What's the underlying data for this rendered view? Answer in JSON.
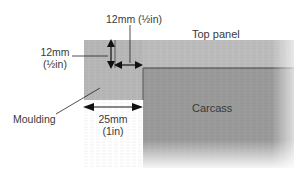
{
  "diagram": {
    "type": "woodworking cross-section",
    "labels": {
      "top_dim_a": "12mm (½in)",
      "left_dim_line1": "12mm",
      "left_dim_line2": "(½in)",
      "top_panel": "Top panel",
      "carcass": "Carcass",
      "moulding": "Moulding",
      "bottom_dim_line1": "25mm",
      "bottom_dim_line2": "(1in)"
    },
    "colors": {
      "moulding": "#b9b9b9",
      "top_panel": "#bdbdbd",
      "carcass": "#9a9a9a",
      "line": "#222222"
    }
  }
}
